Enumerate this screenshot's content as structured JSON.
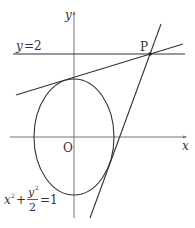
{
  "diagram": {
    "axes": {
      "x_label": "x",
      "y_label": "y",
      "origin_label": "O"
    },
    "horizontal_line": {
      "label_var": "y",
      "label_eq": "=2"
    },
    "point": {
      "label": "P"
    },
    "ellipse": {
      "eq_x": "x",
      "eq_x_exp": "2",
      "eq_plus": "+",
      "eq_num": "y",
      "eq_num_exp": "2",
      "eq_den": "2",
      "eq_rhs": "=1"
    },
    "colors": {
      "stroke": "#333333",
      "axis": "#777777",
      "background": "#ffffff"
    }
  }
}
